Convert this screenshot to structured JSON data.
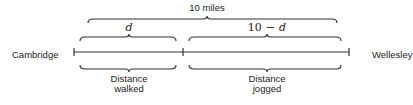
{
  "diagram": {
    "left_endpoint_label": "Cambridge",
    "right_endpoint_label": "Wellesley",
    "total_label": "10 miles",
    "segment_walked": {
      "top_label_var": "d",
      "bottom_label_line1": "Distance",
      "bottom_label_line2": "walked"
    },
    "segment_jogged": {
      "top_label_num": "10",
      "top_label_op": "−",
      "top_label_var": "d",
      "bottom_label_line1": "Distance",
      "bottom_label_line2": "jogged"
    }
  }
}
